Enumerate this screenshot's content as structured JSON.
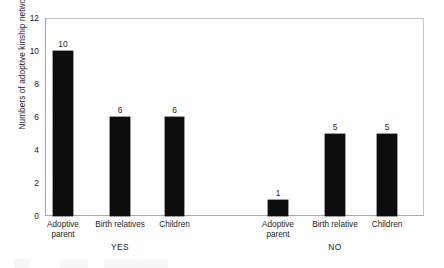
{
  "chart_data": {
    "type": "bar",
    "title": "",
    "xlabel": "",
    "ylabel": "Numbers of adoptive kinship networks",
    "ylim": [
      0,
      12
    ],
    "yticks": [
      0,
      2,
      4,
      6,
      8,
      10,
      12
    ],
    "grid": false,
    "legend": null,
    "bar_color": "#0d0d0d",
    "frame_color": "#b9b9b9",
    "groups": [
      {
        "name": "YES",
        "label": "YES",
        "categories": [
          "Adoptive parent",
          "Birth relatives",
          "Children"
        ],
        "values": [
          10,
          6,
          6
        ]
      },
      {
        "name": "NO",
        "label": "NO",
        "categories": [
          "Adoptive parent",
          "Birth relative",
          "Children"
        ],
        "values": [
          1,
          5,
          5
        ]
      }
    ],
    "categories": [
      "Adoptive parent",
      "Birth relatives",
      "Children",
      "Adoptive parent",
      "Birth relative",
      "Children"
    ],
    "values": [
      10,
      6,
      6,
      1,
      5,
      5
    ],
    "bars": [
      {
        "group": "YES",
        "category": "Adoptive parent",
        "value": 10,
        "value_label": "10",
        "label_line1": "Adoptive",
        "label_line2": "parent",
        "x": 53,
        "width": 20
      },
      {
        "group": "YES",
        "category": "Birth relatives",
        "value": 6,
        "value_label": "6",
        "label_line1": "Birth relatives",
        "label_line2": "",
        "x": 110,
        "width": 20
      },
      {
        "group": "YES",
        "category": "Children",
        "value": 6,
        "value_label": "6",
        "label_line1": "Children",
        "label_line2": "",
        "x": 165,
        "width": 19
      },
      {
        "group": "NO",
        "category": "Adoptive parent",
        "value": 1,
        "value_label": "1",
        "label_line1": "Adoptive",
        "label_line2": "parent",
        "x": 268,
        "width": 20
      },
      {
        "group": "NO",
        "category": "Birth relative",
        "value": 5,
        "value_label": "5",
        "label_line1": "Birth relative",
        "label_line2": "",
        "x": 325,
        "width": 20
      },
      {
        "group": "NO",
        "category": "Children",
        "value": 5,
        "value_label": "5",
        "label_line1": "Children",
        "label_line2": "",
        "x": 377,
        "width": 20
      }
    ],
    "group_label_positions": [
      {
        "label": "YES",
        "x": 110
      },
      {
        "label": "NO",
        "x": 325
      }
    ]
  },
  "axis_geometry": {
    "plot_left": 45,
    "plot_top": 18,
    "plot_right": 424,
    "plot_bottom": 216
  }
}
